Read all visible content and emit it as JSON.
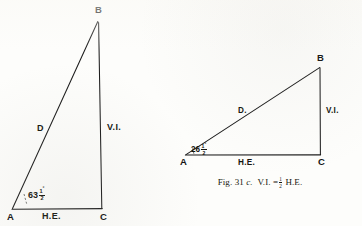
{
  "figure": {
    "caption_prefix": "Fig. 31",
    "caption_letter": "c.",
    "caption_relation_left": "V.I. =",
    "caption_fraction_numerator": "1",
    "caption_fraction_denominator": "2",
    "caption_relation_right": "H.E.",
    "caption_full": "Fig. 31 c.  V.I. = 1/2 H.E.",
    "ink_color": "#1b1b1b",
    "paper_color": "#fdfdfb"
  },
  "left_triangle": {
    "name": "steep-slope-triangle",
    "vertices": {
      "apex_top": "B",
      "angle_vertex": "A",
      "right_angle_vertex": "C"
    },
    "sides": {
      "hypotenuse": "D",
      "vertical": "V.I.",
      "horizontal": "H.E."
    },
    "angle": {
      "whole": "63",
      "numerator": "1",
      "denominator": "2",
      "degree_symbol": "°",
      "text": "63 1/2°"
    }
  },
  "right_triangle": {
    "name": "shallow-slope-triangle",
    "vertices": {
      "apex_top": "B",
      "angle_vertex": "A",
      "right_angle_vertex": "C"
    },
    "sides": {
      "hypotenuse": "D.",
      "vertical": "V.I.",
      "horizontal": "H.E."
    },
    "angle": {
      "whole": "26",
      "numerator": "1",
      "denominator": "2",
      "degree_symbol": "°",
      "text": "26 1/2°"
    }
  },
  "geometry": {
    "left": {
      "A": [
        12,
        209
      ],
      "B": [
        98,
        21
      ],
      "C": [
        102,
        209
      ]
    },
    "right": {
      "A": [
        186,
        155
      ],
      "B": [
        320,
        67
      ],
      "C": [
        320,
        155
      ]
    }
  }
}
